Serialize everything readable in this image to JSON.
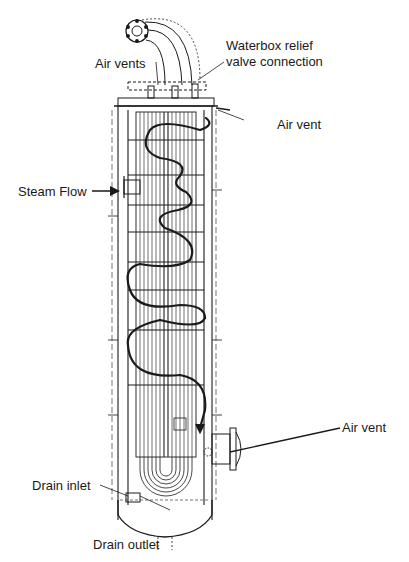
{
  "diagram": {
    "type": "engineering cross-section (vertical heat exchanger / feedwater heater)",
    "labels": {
      "air_vents_top": "Air vents",
      "waterbox_relief_line1": "Waterbox relief",
      "waterbox_relief_line2": "valve connection",
      "air_vent_upper_right": "Air vent",
      "steam_flow": "Steam Flow",
      "air_vent_lower_right": "Air vent",
      "drain_inlet": "Drain inlet",
      "drain_outlet": "Drain outlet"
    },
    "colors": {
      "ink": "#1a1a1a",
      "background": "#ffffff"
    }
  }
}
